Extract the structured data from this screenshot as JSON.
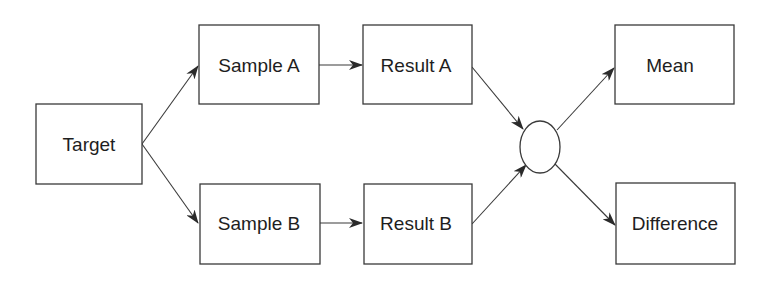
{
  "diagram": {
    "type": "flowchart",
    "stroke_color": "#3a3a3a",
    "text_color": "#1e1e1e",
    "background": "#ffffff",
    "nodes": {
      "target": {
        "label": "Target",
        "shape": "rectangle"
      },
      "sample_a": {
        "label": "Sample A",
        "shape": "rectangle"
      },
      "sample_b": {
        "label": "Sample B",
        "shape": "rectangle"
      },
      "result_a": {
        "label": "Result A",
        "shape": "rectangle"
      },
      "result_b": {
        "label": "Result B",
        "shape": "rectangle"
      },
      "combine": {
        "label": "",
        "shape": "ellipse"
      },
      "mean": {
        "label": "Mean",
        "shape": "rectangle"
      },
      "difference": {
        "label": "Difference",
        "shape": "rectangle"
      }
    },
    "edges": [
      {
        "from": "Target",
        "to": "Sample A"
      },
      {
        "from": "Target",
        "to": "Sample B"
      },
      {
        "from": "Sample A",
        "to": "Result A"
      },
      {
        "from": "Sample B",
        "to": "Result B"
      },
      {
        "from": "Result A",
        "to": "ellipse"
      },
      {
        "from": "Result B",
        "to": "ellipse"
      },
      {
        "from": "ellipse",
        "to": "Mean"
      },
      {
        "from": "ellipse",
        "to": "Difference"
      }
    ]
  }
}
